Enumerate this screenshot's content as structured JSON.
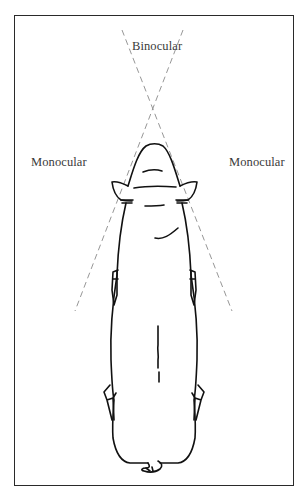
{
  "diagram": {
    "labels": {
      "binocular": "Binocular",
      "monocular_left": "Monocular",
      "monocular_right": "Monocular"
    },
    "vision_lines": {
      "style": "dashed",
      "color": "#8a8a8a",
      "crossing_point": [
        152,
        111
      ],
      "left_line": {
        "from": [
          183,
          30
        ],
        "to": [
          75,
          311
        ]
      },
      "right_line": {
        "from": [
          122,
          30
        ],
        "to": [
          232,
          311
        ]
      }
    },
    "outline_color": "#111111",
    "frame_color": "#2a2a2a"
  }
}
